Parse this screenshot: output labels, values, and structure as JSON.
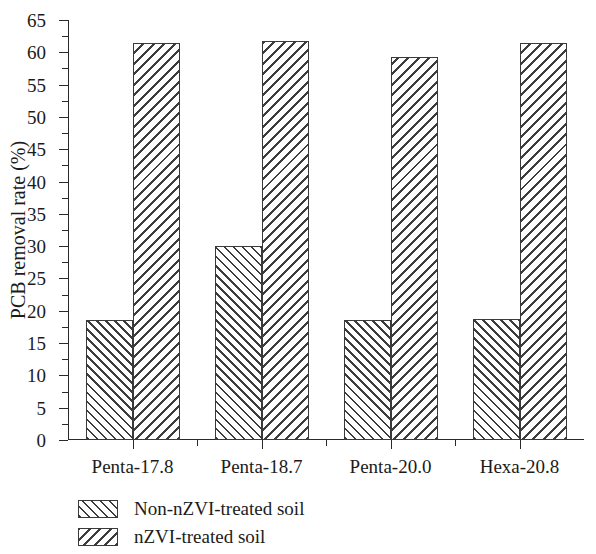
{
  "chart_data": {
    "type": "bar",
    "title": "",
    "subtitle": "",
    "xlabel": "",
    "ylabel": "PCB removal rate (%)",
    "categories": [
      "Penta-17.8",
      "Penta-18.7",
      "Penta-20.0",
      "Hexa-20.8"
    ],
    "series": [
      {
        "name": "Non-nZVI-treated soil",
        "pattern": "diagonal-forward-hatch",
        "values": [
          18.5,
          30.0,
          18.5,
          18.7
        ]
      },
      {
        "name": "nZVI-treated soil",
        "pattern": "diagonal-back-hatch",
        "values": [
          61.5,
          61.7,
          59.2,
          61.5
        ]
      }
    ],
    "ylim": [
      0,
      65
    ],
    "ytick_step": 5,
    "yticks": [
      0,
      5,
      10,
      15,
      20,
      25,
      30,
      35,
      40,
      45,
      50,
      55,
      60,
      65
    ],
    "ytick_labels": [
      "0",
      "5",
      "10",
      "15",
      "20",
      "25",
      "30",
      "35",
      "40",
      "45",
      "50",
      "55",
      "60",
      "65"
    ],
    "minor_ytick_step": 2.5,
    "grid": false,
    "legend_position": "below-left",
    "annotations": [],
    "colors": {
      "axis": "#2a2a2a",
      "bar_edge": "#3a3a3a",
      "hatch": "#3d3d3d",
      "background": "#ffffff",
      "text": "#1b1b1b"
    }
  },
  "legend": {
    "items": [
      {
        "label": "Non-nZVI-treated soil"
      },
      {
        "label": "nZVI-treated soil"
      }
    ]
  }
}
